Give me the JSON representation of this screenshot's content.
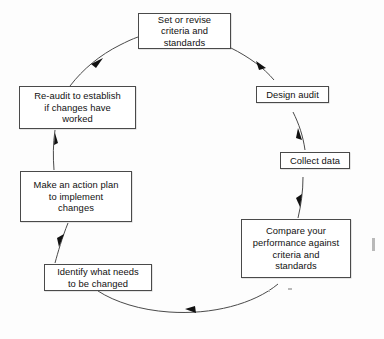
{
  "diagram": {
    "type": "cycle-flowchart",
    "direction": "clockwise",
    "background_color": "#fdfdfd",
    "line_color": "#4a4a4a",
    "text_color": "#111111",
    "nodes": [
      {
        "id": "set-or-revise-criteria-and-standards",
        "label": "Set or revise\ncriteria and\nstandards",
        "position": "top"
      },
      {
        "id": "design-audit",
        "label": "Design audit",
        "position": "upper-right"
      },
      {
        "id": "collect-data",
        "label": "Collect data",
        "position": "right"
      },
      {
        "id": "compare-your-performance",
        "label": "Compare your\nperformance against\ncriteria and\nstandards",
        "position": "lower-right"
      },
      {
        "id": "identify-what-needs-to-be-changed",
        "label": "Identify what needs\nto be changed",
        "position": "bottom-left"
      },
      {
        "id": "make-an-action-plan",
        "label": "Make an action plan\nto implement\nchanges",
        "position": "left"
      },
      {
        "id": "re-audit-to-establish",
        "label": "Re-audit to establish\nif changes have\nworked",
        "position": "upper-left"
      }
    ],
    "edges": [
      {
        "from": "set-or-revise-criteria-and-standards",
        "to": "design-audit"
      },
      {
        "from": "design-audit",
        "to": "collect-data"
      },
      {
        "from": "collect-data",
        "to": "compare-your-performance"
      },
      {
        "from": "compare-your-performance",
        "to": "identify-what-needs-to-be-changed"
      },
      {
        "from": "identify-what-needs-to-be-changed",
        "to": "make-an-action-plan"
      },
      {
        "from": "make-an-action-plan",
        "to": "re-audit-to-establish"
      },
      {
        "from": "re-audit-to-establish",
        "to": "set-or-revise-criteria-and-standards"
      }
    ]
  }
}
